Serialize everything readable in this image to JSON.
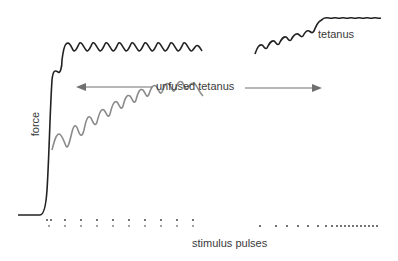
{
  "diagram": {
    "labels": {
      "force": "force",
      "unfused_tetanus": "unfused tetanus",
      "tetanus": "tetanus",
      "stimulus_pulses": "stimulus pulses"
    },
    "colors": {
      "black_trace": "#222222",
      "gray_trace": "#8a8a8a",
      "arrow": "#707070",
      "dots": "#444444",
      "text": "#3a3a3a"
    },
    "traces": [
      {
        "name": "unfused-tetanus-high-frequency",
        "color": "black",
        "description": "rises steeply from baseline, small notch, then oscillates near plateau (~10 ripples)"
      },
      {
        "name": "unfused-tetanus-low-frequency",
        "color": "gray",
        "description": "branches from rise, larger oscillations summating upward (~11 ripples)"
      },
      {
        "name": "fused-tetanus",
        "color": "black",
        "description": "wavy rising trace that becomes nearly smooth plateau"
      }
    ],
    "stimulus_groups": [
      {
        "name": "left-pulse-train",
        "rows": 2,
        "count_per_row": 10
      },
      {
        "name": "right-pulse-train",
        "rows": 1,
        "count": 20,
        "spacing": "increasing frequency"
      }
    ]
  }
}
